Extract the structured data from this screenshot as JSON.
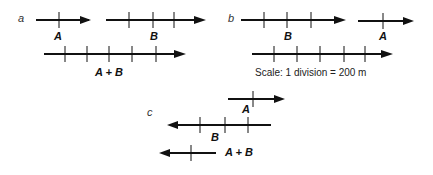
{
  "parts": {
    "a": {
      "label": "a",
      "vectors": [
        {
          "name": "A",
          "label": "A",
          "divisions": 1,
          "direction": "right"
        },
        {
          "name": "B",
          "label": "B",
          "divisions": 4,
          "direction": "right"
        },
        {
          "name": "A+B",
          "label": "A + B",
          "divisions": 5,
          "direction": "right"
        }
      ]
    },
    "b": {
      "label": "b",
      "vectors": [
        {
          "name": "B",
          "label": "B",
          "divisions": 4,
          "direction": "right"
        },
        {
          "name": "A",
          "label": "A",
          "divisions": 1,
          "direction": "right"
        },
        {
          "name": "B+A",
          "label": "",
          "divisions": 5,
          "direction": "right"
        }
      ],
      "scale_text": "Scale: 1 division = 200 m"
    },
    "c": {
      "label": "c",
      "vectors": [
        {
          "name": "A",
          "label": "A",
          "divisions": 2,
          "direction": "right"
        },
        {
          "name": "B",
          "label": "B",
          "divisions": 4,
          "direction": "left"
        },
        {
          "name": "A+B",
          "label": "A + B",
          "divisions": 2,
          "direction": "left"
        }
      ]
    }
  }
}
